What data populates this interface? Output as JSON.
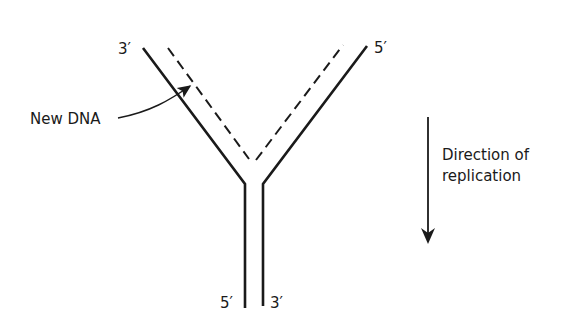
{
  "diagram": {
    "labels": {
      "top_left_end": "3′",
      "top_right_end": "5′",
      "bottom_left_end": "5′",
      "bottom_right_end": "3′",
      "new_dna": "New DNA",
      "direction_line1": "Direction of",
      "direction_line2": "replication"
    },
    "colors": {
      "stroke": "#1a1a1a",
      "background": "#ffffff"
    }
  }
}
